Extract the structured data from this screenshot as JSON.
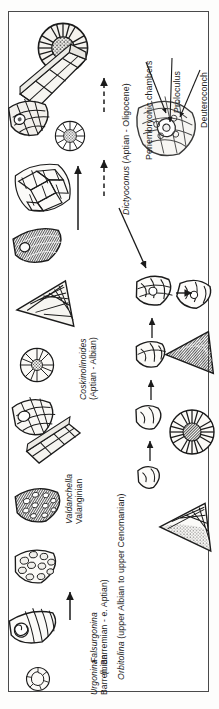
{
  "figure": {
    "orientation": "labels rotated 90 degrees counter-clockwise",
    "border_color": "#4a4a4a",
    "background_color": "#ffffff",
    "ink_color": "#1b1b1b"
  },
  "taxa": [
    {
      "id": "urgonina",
      "genus": "Urgonina",
      "range": "Barremian",
      "lineage": "lower"
    },
    {
      "id": "falsurgonina",
      "genus": "Falsurgonina",
      "range": "(l. Barremian - e. Aptian)",
      "lineage": "lower"
    },
    {
      "id": "valdanchella",
      "genus": "Valdanchella",
      "range": "Valanginian",
      "lineage": "lower"
    },
    {
      "id": "coskinolinoides",
      "genus": "Coskinolinoides",
      "range": "(Aptian - Albian)",
      "lineage": "middle"
    },
    {
      "id": "dictyoconus",
      "genus": "Dictyoconus",
      "range": "(Aptian - Oligocene)",
      "combined": "Dictyoconus (Aptian - Oligocene)",
      "lineage": "upper"
    },
    {
      "id": "orbitolina",
      "genus": "Orbitolina",
      "range": "(upper Albian to upper Cenomanian)",
      "combined": "Orbitolina (upper Albian to upper Cenomanian)",
      "lineage": "lower-right"
    }
  ],
  "annotations": [
    {
      "id": "periembryonic",
      "label": "Periembryonic chambers"
    },
    {
      "id": "proloculus",
      "label": "Proloculus"
    },
    {
      "id": "deuteroconch",
      "label": "Deuteroconch"
    }
  ],
  "specimens": [
    {
      "id": "urgonina-section",
      "kind": "axial-section-drawing"
    },
    {
      "id": "urgonina-equatorial",
      "kind": "equatorial-section-drawing"
    },
    {
      "id": "urgonina-conical",
      "kind": "conical-test-drawing"
    },
    {
      "id": "falsurgonina-test",
      "kind": "conical-test-drawing"
    },
    {
      "id": "valdanchella-test",
      "kind": "conical-test-drawing"
    },
    {
      "id": "valdanchella-section",
      "kind": "axial-section-drawing"
    },
    {
      "id": "coskinolinoides-cone",
      "kind": "conical-test-drawing"
    },
    {
      "id": "coskinolinoides-disc",
      "kind": "equatorial-section-drawing"
    },
    {
      "id": "coskinolinoides-triangle",
      "kind": "axial-section-drawing"
    },
    {
      "id": "coskinolinoides-dark",
      "kind": "axial-section-drawing"
    },
    {
      "id": "dictyoconus-skeletal",
      "kind": "skeletal-mesh-drawing"
    },
    {
      "id": "dictyoconus-cone",
      "kind": "conical-test-drawing"
    },
    {
      "id": "dictyoconus-disc-small",
      "kind": "equatorial-section-drawing"
    },
    {
      "id": "dictyoconus-disc-large",
      "kind": "equatorial-section-drawing"
    },
    {
      "id": "dictyoconus-prism",
      "kind": "prismatic-section-drawing"
    },
    {
      "id": "embryo-detail",
      "kind": "embryonic-apparatus-detail"
    },
    {
      "id": "orbitolina-embryo-1",
      "kind": "embryonic-apparatus-drawing"
    },
    {
      "id": "orbitolina-embryo-2",
      "kind": "embryonic-apparatus-drawing"
    },
    {
      "id": "orbitolina-embryo-3",
      "kind": "embryonic-apparatus-drawing"
    },
    {
      "id": "orbitolina-embryo-4",
      "kind": "embryonic-apparatus-drawing"
    },
    {
      "id": "orbitolina-embryo-5",
      "kind": "embryonic-apparatus-drawing"
    },
    {
      "id": "orbitolina-triangle-dark",
      "kind": "axial-section-drawing"
    },
    {
      "id": "orbitolina-disc-dark",
      "kind": "equatorial-section-drawing"
    },
    {
      "id": "orbitolina-triangle-light",
      "kind": "axial-section-drawing"
    }
  ],
  "arrows": [
    {
      "id": "arrow-urgonina-to-falsurgonina",
      "style": "solid"
    },
    {
      "id": "arrow-coskinolinoides-to-dictyoconus",
      "style": "solid"
    },
    {
      "id": "arrow-dictyoconus-stage-1",
      "style": "dashed"
    },
    {
      "id": "arrow-dictyoconus-stage-2",
      "style": "dashed"
    },
    {
      "id": "arrow-dictyoconus-stage-3",
      "style": "dashed"
    },
    {
      "id": "arrow-to-orbitolina-lineage",
      "style": "solid"
    },
    {
      "id": "arrow-orbitolina-stage-1",
      "style": "solid"
    },
    {
      "id": "arrow-orbitolina-stage-2",
      "style": "solid"
    },
    {
      "id": "arrow-orbitolina-stage-3",
      "style": "solid"
    },
    {
      "id": "arrow-orbitolina-split",
      "style": "solid"
    },
    {
      "id": "leader-periembryonic",
      "style": "leader"
    },
    {
      "id": "leader-proloculus",
      "style": "leader"
    },
    {
      "id": "leader-deuteroconch",
      "style": "leader"
    }
  ]
}
